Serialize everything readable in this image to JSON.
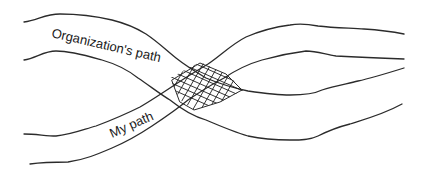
{
  "diagram": {
    "type": "crossing-paths",
    "style": "hand-drawn line sketch",
    "stroke_color": "#2b2b2b",
    "background": "#ffffff",
    "paths": [
      {
        "id": "organization-path",
        "label": "Organization's path"
      },
      {
        "id": "my-path",
        "label": "My path"
      }
    ],
    "overlap": {
      "description": "crosshatched region where the two paths intersect"
    }
  }
}
